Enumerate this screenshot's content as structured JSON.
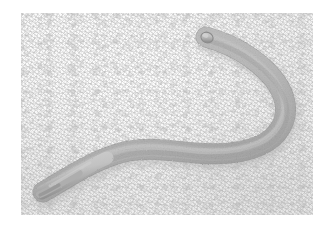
{
  "figure": {
    "canvas_width": 329,
    "canvas_height": 232,
    "page_background": "#ffffff",
    "caption": ""
  },
  "photo_plate": {
    "left": 21,
    "top": 13,
    "width": 292,
    "height": 202,
    "substrate_label": "agar-plate-surface",
    "background_color": "#f2f2f2",
    "background_highlight": "#fbfbfb",
    "background_shadow": "#e8e8e8",
    "texture": "fine-granular-mottled"
  },
  "specimen": {
    "name": "nematode-worm",
    "common_description": "worm",
    "orientation": "hook-shaped, head upper-right, tail lower-left",
    "body_outline_color": "#8a8a8a",
    "body_fill_light": "#c6c6c6",
    "body_fill_mid": "#b0b0b0",
    "body_fill_dark": "#949494",
    "shadow_color": "#b4b4b4",
    "head_tip": {
      "x": 205,
      "y": 36,
      "label": "anterior-head-end"
    },
    "tail_tip": {
      "x": 42,
      "y": 192,
      "label": "posterior-tail-end"
    },
    "bend_apex": {
      "x": 289,
      "y": 106,
      "label": "u-bend-apex"
    },
    "midline_points": [
      {
        "x": 206,
        "y": 37
      },
      {
        "x": 226,
        "y": 45
      },
      {
        "x": 248,
        "y": 60
      },
      {
        "x": 268,
        "y": 78
      },
      {
        "x": 281,
        "y": 96
      },
      {
        "x": 285,
        "y": 115
      },
      {
        "x": 276,
        "y": 133
      },
      {
        "x": 258,
        "y": 146
      },
      {
        "x": 234,
        "y": 153
      },
      {
        "x": 208,
        "y": 154
      },
      {
        "x": 180,
        "y": 151
      },
      {
        "x": 154,
        "y": 149
      },
      {
        "x": 128,
        "y": 152
      },
      {
        "x": 104,
        "y": 161
      },
      {
        "x": 80,
        "y": 173
      },
      {
        "x": 60,
        "y": 184
      },
      {
        "x": 44,
        "y": 191
      }
    ],
    "width_profile": [
      {
        "t": 0.0,
        "w": 5.0
      },
      {
        "t": 0.06,
        "w": 7.0
      },
      {
        "t": 0.18,
        "w": 9.0
      },
      {
        "t": 0.34,
        "w": 11.0
      },
      {
        "t": 0.5,
        "w": 12.5
      },
      {
        "t": 0.64,
        "w": 13.0
      },
      {
        "t": 0.78,
        "w": 12.0
      },
      {
        "t": 0.9,
        "w": 8.5
      },
      {
        "t": 1.0,
        "w": 2.0
      }
    ]
  }
}
